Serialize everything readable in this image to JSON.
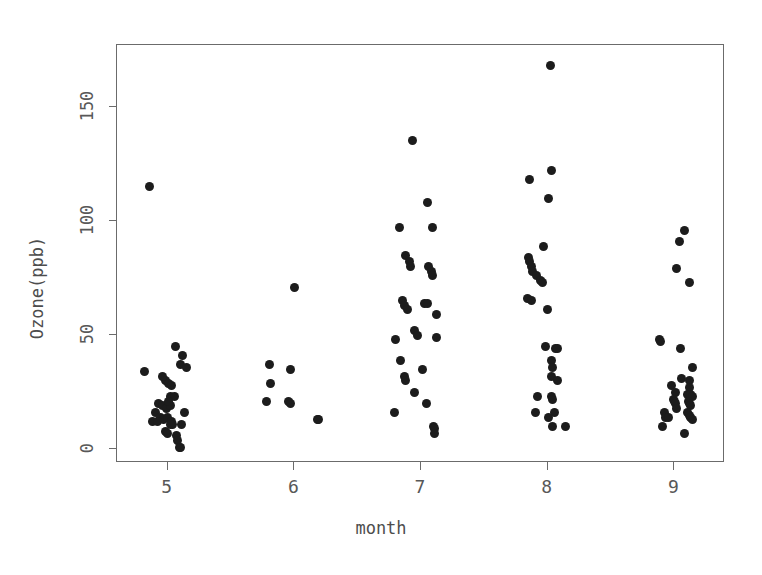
{
  "chart_data": {
    "type": "scatter",
    "title": "",
    "subtitle": "",
    "xlabel": "month",
    "ylabel": "Ozone(ppb)",
    "xlim": [
      4.6,
      9.4
    ],
    "ylim": [
      -6,
      177
    ],
    "grid": false,
    "legend": null,
    "x_ticks": [
      5,
      6,
      7,
      8,
      9
    ],
    "x_tick_labels": [
      "5",
      "6",
      "7",
      "8",
      "9"
    ],
    "y_ticks": [
      0,
      50,
      100,
      150
    ],
    "y_tick_labels": [
      "0",
      "50",
      "100",
      "150"
    ],
    "marker": {
      "shape": "circle",
      "color": "#1c1c1c",
      "size_px": 9
    },
    "note": "Jittered strip chart of Ozone concentration by month (R airquality dataset). x values include horizontal jitter around each integer month.",
    "series": [
      {
        "name": "Ozone",
        "categories": [
          5,
          6,
          7,
          8,
          9
        ],
        "points": [
          {
            "x": 4.86,
            "y": 115
          },
          {
            "x": 4.82,
            "y": 34
          },
          {
            "x": 5.06,
            "y": 45
          },
          {
            "x": 5.12,
            "y": 41
          },
          {
            "x": 5.1,
            "y": 37
          },
          {
            "x": 5.15,
            "y": 36
          },
          {
            "x": 4.98,
            "y": 30
          },
          {
            "x": 5.01,
            "y": 29
          },
          {
            "x": 5.03,
            "y": 28
          },
          {
            "x": 4.96,
            "y": 32
          },
          {
            "x": 5.02,
            "y": 23
          },
          {
            "x": 5.05,
            "y": 23
          },
          {
            "x": 4.93,
            "y": 20
          },
          {
            "x": 4.96,
            "y": 19
          },
          {
            "x": 4.99,
            "y": 18
          },
          {
            "x": 5.02,
            "y": 19
          },
          {
            "x": 5.01,
            "y": 21
          },
          {
            "x": 4.9,
            "y": 16
          },
          {
            "x": 4.94,
            "y": 14
          },
          {
            "x": 4.97,
            "y": 13
          },
          {
            "x": 5.0,
            "y": 14
          },
          {
            "x": 5.03,
            "y": 12
          },
          {
            "x": 5.13,
            "y": 16
          },
          {
            "x": 5.11,
            "y": 11
          },
          {
            "x": 4.88,
            "y": 12
          },
          {
            "x": 4.92,
            "y": 12
          },
          {
            "x": 4.98,
            "y": 8
          },
          {
            "x": 5.0,
            "y": 7
          },
          {
            "x": 5.04,
            "y": 11
          },
          {
            "x": 5.07,
            "y": 6
          },
          {
            "x": 5.08,
            "y": 4
          },
          {
            "x": 5.09,
            "y": 1
          },
          {
            "x": 5.1,
            "y": 1
          },
          {
            "x": 5.02,
            "y": 11
          },
          {
            "x": 6.0,
            "y": 71
          },
          {
            "x": 5.8,
            "y": 37
          },
          {
            "x": 5.97,
            "y": 35
          },
          {
            "x": 5.81,
            "y": 29
          },
          {
            "x": 5.78,
            "y": 21
          },
          {
            "x": 5.95,
            "y": 21
          },
          {
            "x": 5.97,
            "y": 20
          },
          {
            "x": 6.19,
            "y": 13
          },
          {
            "x": 6.18,
            "y": 13
          },
          {
            "x": 6.93,
            "y": 135
          },
          {
            "x": 7.05,
            "y": 108
          },
          {
            "x": 6.83,
            "y": 97
          },
          {
            "x": 7.09,
            "y": 97
          },
          {
            "x": 6.88,
            "y": 85
          },
          {
            "x": 6.91,
            "y": 82
          },
          {
            "x": 6.92,
            "y": 80
          },
          {
            "x": 7.06,
            "y": 80
          },
          {
            "x": 7.08,
            "y": 78
          },
          {
            "x": 7.09,
            "y": 76
          },
          {
            "x": 6.85,
            "y": 65
          },
          {
            "x": 6.87,
            "y": 63
          },
          {
            "x": 6.89,
            "y": 61
          },
          {
            "x": 7.03,
            "y": 64
          },
          {
            "x": 7.05,
            "y": 64
          },
          {
            "x": 7.12,
            "y": 59
          },
          {
            "x": 6.8,
            "y": 48
          },
          {
            "x": 6.95,
            "y": 52
          },
          {
            "x": 6.97,
            "y": 50
          },
          {
            "x": 7.12,
            "y": 49
          },
          {
            "x": 6.84,
            "y": 39
          },
          {
            "x": 7.01,
            "y": 35
          },
          {
            "x": 6.87,
            "y": 32
          },
          {
            "x": 6.88,
            "y": 30
          },
          {
            "x": 6.95,
            "y": 25
          },
          {
            "x": 7.04,
            "y": 20
          },
          {
            "x": 6.79,
            "y": 16
          },
          {
            "x": 7.1,
            "y": 10
          },
          {
            "x": 7.11,
            "y": 9
          },
          {
            "x": 7.11,
            "y": 7
          },
          {
            "x": 8.02,
            "y": 168
          },
          {
            "x": 8.03,
            "y": 122
          },
          {
            "x": 7.86,
            "y": 118
          },
          {
            "x": 8.01,
            "y": 110
          },
          {
            "x": 7.97,
            "y": 89
          },
          {
            "x": 7.85,
            "y": 84
          },
          {
            "x": 7.86,
            "y": 82
          },
          {
            "x": 7.87,
            "y": 80
          },
          {
            "x": 7.88,
            "y": 78
          },
          {
            "x": 7.91,
            "y": 76
          },
          {
            "x": 7.94,
            "y": 74
          },
          {
            "x": 7.96,
            "y": 73
          },
          {
            "x": 7.84,
            "y": 66
          },
          {
            "x": 7.87,
            "y": 65
          },
          {
            "x": 8.0,
            "y": 61
          },
          {
            "x": 7.98,
            "y": 45
          },
          {
            "x": 8.06,
            "y": 44
          },
          {
            "x": 8.08,
            "y": 44
          },
          {
            "x": 8.03,
            "y": 39
          },
          {
            "x": 8.04,
            "y": 36
          },
          {
            "x": 8.03,
            "y": 32
          },
          {
            "x": 8.08,
            "y": 30
          },
          {
            "x": 7.92,
            "y": 23
          },
          {
            "x": 8.03,
            "y": 23
          },
          {
            "x": 8.04,
            "y": 22
          },
          {
            "x": 7.9,
            "y": 16
          },
          {
            "x": 8.05,
            "y": 16
          },
          {
            "x": 8.01,
            "y": 14
          },
          {
            "x": 8.04,
            "y": 10
          },
          {
            "x": 8.14,
            "y": 10
          },
          {
            "x": 9.08,
            "y": 96
          },
          {
            "x": 9.04,
            "y": 91
          },
          {
            "x": 9.02,
            "y": 79
          },
          {
            "x": 9.12,
            "y": 73
          },
          {
            "x": 8.88,
            "y": 48
          },
          {
            "x": 8.89,
            "y": 47
          },
          {
            "x": 9.05,
            "y": 44
          },
          {
            "x": 9.14,
            "y": 36
          },
          {
            "x": 9.06,
            "y": 31
          },
          {
            "x": 9.12,
            "y": 30
          },
          {
            "x": 8.98,
            "y": 28
          },
          {
            "x": 9.12,
            "y": 27
          },
          {
            "x": 9.01,
            "y": 25
          },
          {
            "x": 9.1,
            "y": 24
          },
          {
            "x": 9.13,
            "y": 24
          },
          {
            "x": 9.14,
            "y": 23
          },
          {
            "x": 8.99,
            "y": 22
          },
          {
            "x": 9.0,
            "y": 21
          },
          {
            "x": 9.11,
            "y": 21
          },
          {
            "x": 9.12,
            "y": 20
          },
          {
            "x": 9.13,
            "y": 19
          },
          {
            "x": 9.01,
            "y": 20
          },
          {
            "x": 9.02,
            "y": 18
          },
          {
            "x": 8.92,
            "y": 16
          },
          {
            "x": 8.93,
            "y": 14
          },
          {
            "x": 8.95,
            "y": 14
          },
          {
            "x": 9.1,
            "y": 16
          },
          {
            "x": 9.12,
            "y": 15
          },
          {
            "x": 9.13,
            "y": 14
          },
          {
            "x": 8.91,
            "y": 10
          },
          {
            "x": 9.08,
            "y": 7
          },
          {
            "x": 9.14,
            "y": 13
          }
        ]
      }
    ]
  }
}
